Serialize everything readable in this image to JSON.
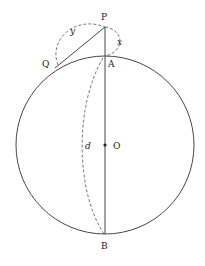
{
  "diagram": {
    "labels": {
      "P": "P",
      "Q": "Q",
      "A": "A",
      "O": "O",
      "B": "B",
      "d": "d",
      "x": "x",
      "y": "y"
    },
    "colors": {
      "line": "#333333",
      "dashed": "#555555",
      "background": "#ffffff"
    },
    "geometry": {
      "circle_center": [
        105,
        145
      ],
      "circle_radius": 89,
      "P": [
        105,
        27
      ],
      "Q": [
        58,
        65
      ],
      "A": [
        105,
        56
      ],
      "B": [
        105,
        234
      ]
    }
  }
}
